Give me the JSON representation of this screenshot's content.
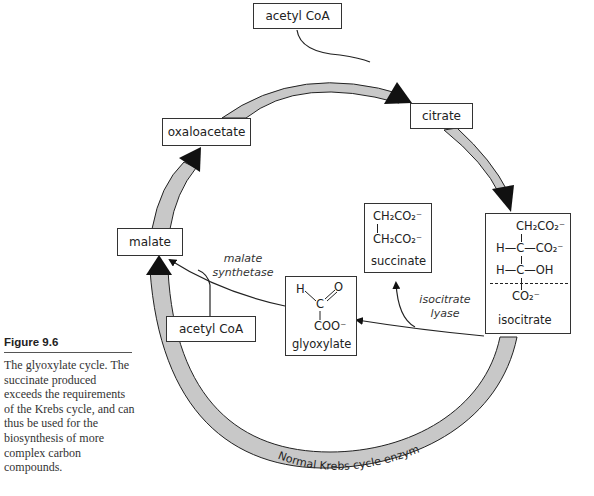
{
  "caption": {
    "figure_label": "Figure 9.6",
    "text": "The glyoxylate cycle. The succinate produced exceeds the requirements of the Krebs cycle, and can thus be used for the biosynthesis of more complex carbon compounds."
  },
  "nodes": {
    "acetyl_coa_top": "acetyl CoA",
    "citrate": "citrate",
    "oxaloacetate": "oxaloacetate",
    "malate": "malate",
    "acetyl_coa_bottom": "acetyl CoA",
    "succinate": {
      "line1": "CH₂CO₂⁻",
      "line2": "CH₂CO₂⁻",
      "name": "succinate"
    },
    "glyoxylate": {
      "h": "H",
      "c": "C",
      "o": "O",
      "coo": "COO⁻",
      "name": "glyoxylate"
    },
    "isocitrate": {
      "row1": "CH₂CO₂⁻",
      "row2_left": "H—C—CO₂⁻",
      "row3_left": "H—C—OH",
      "row4": "CO₂⁻",
      "name": "isocitrate"
    }
  },
  "enzymes": {
    "malate_synthetase_1": "malate",
    "malate_synthetase_2": "synthetase",
    "isocitrate_lyase_1": "isocitrate",
    "isocitrate_lyase_2": "lyase",
    "krebs": "Normal Krebs cycle enzymes"
  },
  "colors": {
    "arc_fill": "#c8c8c8",
    "arc_stroke": "#222222",
    "arrow_head": "#111111",
    "box_border": "#333333"
  }
}
